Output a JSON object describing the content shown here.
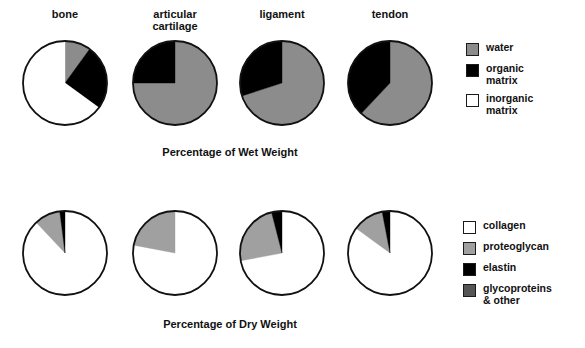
{
  "figure": {
    "columns": [
      "bone",
      "articular\ncartilage",
      "ligament",
      "tendon"
    ],
    "caption_top": "Percentage of Wet Weight",
    "caption_bottom": "Percentage of Dry Weight"
  },
  "colors": {
    "water": "#8c8c8c",
    "organic_matrix": "#000000",
    "inorganic_matrix": "#ffffff",
    "collagen": "#ffffff",
    "proteoglycan": "#a0a0a0",
    "elastin": "#000000",
    "glycoproteins": "#555555",
    "outline": "#111111"
  },
  "legend_top": {
    "items": [
      {
        "label": "water",
        "color": "#8c8c8c"
      },
      {
        "label": "organic\nmatrix",
        "color": "#000000"
      },
      {
        "label": "inorganic\nmatrix",
        "color": "#ffffff"
      }
    ]
  },
  "legend_bottom": {
    "items": [
      {
        "label": "collagen",
        "color": "#ffffff"
      },
      {
        "label": "proteoglycan",
        "color": "#a0a0a0"
      },
      {
        "label": "elastin",
        "color": "#000000"
      },
      {
        "label": "glycoproteins\n& other",
        "color": "#555555"
      }
    ]
  },
  "chart_data": [
    {
      "type": "pie",
      "title": "Percentage of Wet Weight",
      "tissue": "bone",
      "labels": [
        "water",
        "organic matrix",
        "inorganic matrix"
      ],
      "values": [
        10,
        25,
        65
      ],
      "colors": [
        "#8c8c8c",
        "#000000",
        "#ffffff"
      ],
      "start_angle": 0,
      "direction": "clockwise"
    },
    {
      "type": "pie",
      "title": "Percentage of Wet Weight",
      "tissue": "articular cartilage",
      "labels": [
        "water",
        "organic matrix",
        "inorganic matrix"
      ],
      "values": [
        75,
        25,
        0
      ],
      "colors": [
        "#8c8c8c",
        "#000000",
        "#ffffff"
      ],
      "start_angle": 0,
      "direction": "clockwise"
    },
    {
      "type": "pie",
      "title": "Percentage of Wet Weight",
      "tissue": "ligament",
      "labels": [
        "water",
        "organic matrix",
        "inorganic matrix"
      ],
      "values": [
        70,
        30,
        0
      ],
      "colors": [
        "#8c8c8c",
        "#000000",
        "#ffffff"
      ],
      "start_angle": 0,
      "direction": "clockwise"
    },
    {
      "type": "pie",
      "title": "Percentage of Wet Weight",
      "tissue": "tendon",
      "labels": [
        "water",
        "organic matrix",
        "inorganic matrix"
      ],
      "values": [
        62,
        38,
        0
      ],
      "colors": [
        "#8c8c8c",
        "#000000",
        "#ffffff"
      ],
      "start_angle": 0,
      "direction": "clockwise"
    },
    {
      "type": "pie",
      "title": "Percentage of Dry Weight",
      "tissue": "bone",
      "labels": [
        "collagen",
        "proteoglycan",
        "elastin",
        "glycoproteins & other"
      ],
      "values": [
        88,
        10,
        2,
        0
      ],
      "colors": [
        "#ffffff",
        "#a0a0a0",
        "#000000",
        "#555555"
      ],
      "start_angle": 0,
      "direction": "clockwise"
    },
    {
      "type": "pie",
      "title": "Percentage of Dry Weight",
      "tissue": "articular cartilage",
      "labels": [
        "collagen",
        "proteoglycan",
        "elastin",
        "glycoproteins & other"
      ],
      "values": [
        78,
        22,
        0,
        0
      ],
      "colors": [
        "#ffffff",
        "#a0a0a0",
        "#000000",
        "#555555"
      ],
      "start_angle": 0,
      "direction": "clockwise"
    },
    {
      "type": "pie",
      "title": "Percentage of Dry Weight",
      "tissue": "ligament",
      "labels": [
        "collagen",
        "proteoglycan",
        "elastin",
        "glycoproteins & other"
      ],
      "values": [
        72,
        24,
        4,
        0
      ],
      "colors": [
        "#ffffff",
        "#a0a0a0",
        "#000000",
        "#555555"
      ],
      "start_angle": 0,
      "direction": "clockwise"
    },
    {
      "type": "pie",
      "title": "Percentage of Dry Weight",
      "tissue": "tendon",
      "labels": [
        "collagen",
        "proteoglycan",
        "elastin",
        "glycoproteins & other"
      ],
      "values": [
        85,
        12,
        3,
        0
      ],
      "colors": [
        "#ffffff",
        "#a0a0a0",
        "#000000",
        "#555555"
      ],
      "start_angle": 0,
      "direction": "clockwise"
    }
  ],
  "layout": {
    "pie_radius": 42,
    "row_top_cy": 83,
    "row_bottom_cy": 253,
    "centers_x": [
      65,
      175,
      282,
      390
    ]
  }
}
